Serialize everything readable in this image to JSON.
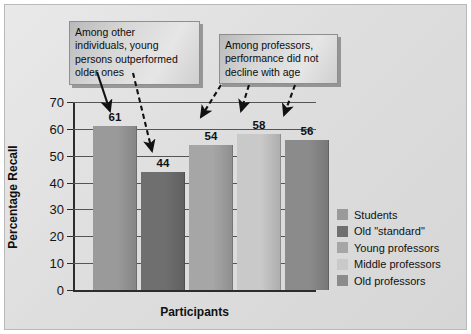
{
  "chart_data": {
    "type": "bar",
    "title": "",
    "xlabel": "Participants",
    "ylabel": "Percentage Recall",
    "categories": [
      "Students",
      "Old \"standard\"",
      "Young professors",
      "Middle professors",
      "Old professors"
    ],
    "values": [
      61,
      44,
      54,
      58,
      56
    ],
    "value_labels": [
      "61",
      "44",
      "54",
      "58",
      "56"
    ],
    "ylim": [
      0,
      70
    ],
    "yticks": [
      70,
      60,
      50,
      40,
      30,
      20,
      10,
      0
    ],
    "ytick_labels": [
      "70",
      "60",
      "50",
      "40",
      "30",
      "20",
      "10",
      "0"
    ],
    "grid": true,
    "legend_position": "right",
    "series_colors": [
      "#9a9a9a",
      "#6f6f6f",
      "#a6a6a6",
      "#c9c9c9",
      "#8b8b8b"
    ]
  },
  "annotations": [
    {
      "id": "callout-other-individuals",
      "text": "Among other individuals, young persons outperformed older ones",
      "lines": [
        "Among other",
        "individuals, young",
        "persons outperformed",
        "older ones"
      ],
      "targets": [
        "61",
        "44"
      ]
    },
    {
      "id": "callout-professors",
      "text": "Among professors, performance did not decline with age",
      "lines": [
        "Among professors,",
        "performance did not",
        "decline with age"
      ],
      "targets": [
        "54",
        "58",
        "56"
      ]
    }
  ],
  "legend": {
    "items": [
      {
        "label": "Students",
        "color": "#9a9a9a"
      },
      {
        "label": "Old \"standard\"",
        "color": "#6f6f6f"
      },
      {
        "label": "Young professors",
        "color": "#a6a6a6"
      },
      {
        "label": "Middle professors",
        "color": "#c9c9c9"
      },
      {
        "label": "Old professors",
        "color": "#8b8b8b"
      }
    ]
  },
  "colors": {
    "background": "#e3e3e3",
    "axis": "#2c2c2c",
    "grid": "#555555",
    "text": "#111111"
  }
}
